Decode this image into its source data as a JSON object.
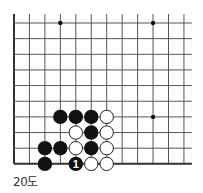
{
  "diagram": {
    "caption": "20도",
    "grid": {
      "origin_x": 14,
      "origin_y": 23,
      "spacing_x": 15.45,
      "spacing_y": 15.65,
      "cols": 12,
      "rows": 10,
      "extend_top": 9,
      "extend_right": 8,
      "left_edge": true,
      "bottom_edge": true
    },
    "star_points": [
      {
        "col": 3,
        "row": 0
      },
      {
        "col": 9,
        "row": 0
      },
      {
        "col": 9,
        "row": 6
      }
    ],
    "stones": [
      {
        "col": 3,
        "row": 6,
        "color": "black"
      },
      {
        "col": 4,
        "row": 6,
        "color": "black"
      },
      {
        "col": 5,
        "row": 6,
        "color": "black"
      },
      {
        "col": 6,
        "row": 6,
        "color": "white"
      },
      {
        "col": 4,
        "row": 7,
        "color": "white"
      },
      {
        "col": 5,
        "row": 7,
        "color": "black"
      },
      {
        "col": 6,
        "row": 7,
        "color": "white"
      },
      {
        "col": 2,
        "row": 8,
        "color": "black"
      },
      {
        "col": 3,
        "row": 8,
        "color": "black"
      },
      {
        "col": 4,
        "row": 8,
        "color": "white"
      },
      {
        "col": 5,
        "row": 8,
        "color": "black"
      },
      {
        "col": 6,
        "row": 8,
        "color": "white"
      },
      {
        "col": 2,
        "row": 9,
        "color": "black"
      },
      {
        "col": 4,
        "row": 9,
        "color": "black",
        "label": "1"
      },
      {
        "col": 5,
        "row": 9,
        "color": "white"
      },
      {
        "col": 6,
        "row": 9,
        "color": "white"
      }
    ],
    "colors": {
      "line": "#555555",
      "edge": "#333333",
      "black_stone": "#111111",
      "white_stone": "#ffffff",
      "white_stroke": "#222222"
    }
  }
}
